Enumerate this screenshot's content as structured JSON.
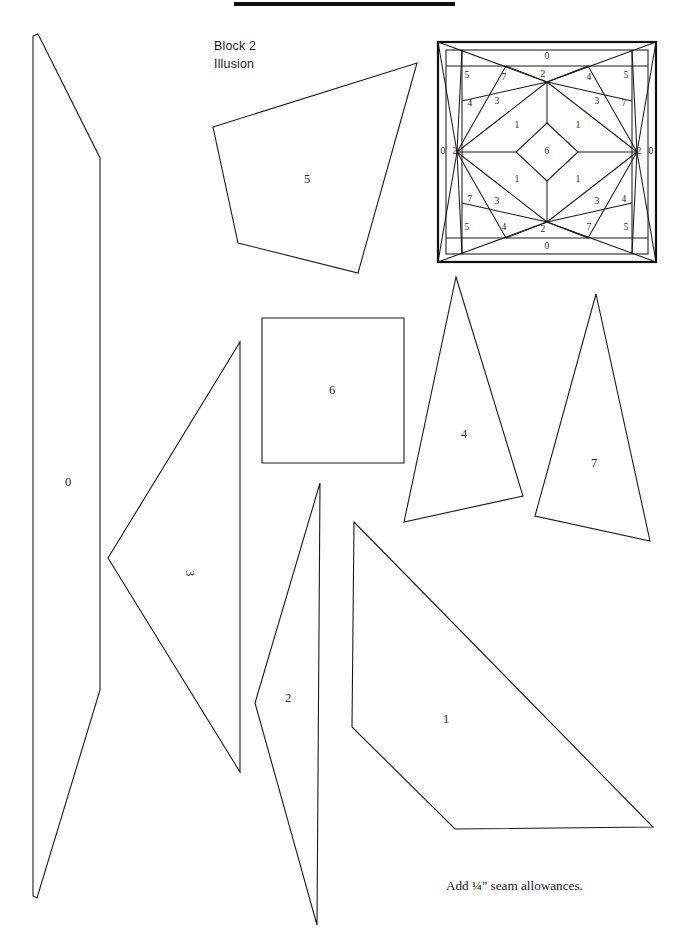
{
  "page": {
    "width": 689,
    "height": 952,
    "background": "#ffffff",
    "ink": "#1a1a1a",
    "title": "Block 2",
    "subtitle": "Illusion",
    "seam_note": "Add ¼\" seam allowances.",
    "rule_bar": {
      "x": 234,
      "y": 2,
      "width": 221,
      "height": 4
    }
  },
  "block_diagram": {
    "name": "block-2-illusion-layout",
    "bounds": {
      "x": 438,
      "y": 42,
      "width": 218,
      "height": 220
    },
    "border_label": "0",
    "hub_label": "2",
    "center_label": "6",
    "labels": {
      "border_top": "0",
      "border_bottom": "0",
      "border_left": "0",
      "border_right": "0",
      "hub_top": "2",
      "hub_bottom": "2",
      "hub_left": "2",
      "hub_right": "2",
      "center": "6",
      "inner_triangles": [
        "1",
        "1",
        "1",
        "1"
      ],
      "mid_triangles": [
        "3",
        "3",
        "3",
        "3"
      ],
      "corner_kites": [
        "5",
        "5",
        "5",
        "5"
      ],
      "wedges_a": [
        "7",
        "7",
        "7",
        "7"
      ],
      "wedges_b": [
        "4",
        "4",
        "4",
        "4"
      ]
    }
  },
  "pieces": [
    {
      "id": "piece-0",
      "label": "0",
      "shape": "elongated-hexagon-strip",
      "points": "38,34 100,158 100,690 37,898 33,896 33,36",
      "label_x": 68,
      "label_y": 483,
      "rotation": 0
    },
    {
      "id": "piece-5",
      "label": "5",
      "shape": "quadrilateral",
      "points": "213,127 417,63 358,273 238,243",
      "label_x": 307,
      "label_y": 180,
      "rotation": 0
    },
    {
      "id": "piece-6",
      "label": "6",
      "shape": "square",
      "points": "262,318 404,318 404,463 262,463",
      "label_x": 332,
      "label_y": 391,
      "rotation": 0
    },
    {
      "id": "piece-3",
      "label": "3",
      "shape": "triangle",
      "points": "240,342 240,772 108,558",
      "label_x": 189,
      "label_y": 573,
      "rotation": 90
    },
    {
      "id": "piece-4",
      "label": "4",
      "shape": "triangle",
      "points": "456,277 523,496 404,522",
      "label_x": 464,
      "label_y": 435,
      "rotation": 0
    },
    {
      "id": "piece-7",
      "label": "7",
      "shape": "triangle",
      "points": "596,294 650,541 535,516",
      "label_x": 594,
      "label_y": 464,
      "rotation": 0
    },
    {
      "id": "piece-2",
      "label": "2",
      "shape": "narrow-triangle",
      "points": "320,483 317,925 255,703",
      "label_x": 288,
      "label_y": 699,
      "rotation": 0
    },
    {
      "id": "piece-1",
      "label": "1",
      "shape": "quadrilateral",
      "points": "354,522 653,827 455,829 352,727",
      "label_x": 446,
      "label_y": 720,
      "rotation": 0
    }
  ]
}
